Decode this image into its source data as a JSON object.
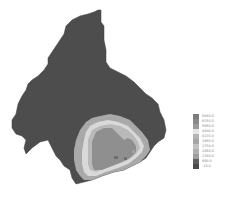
{
  "map": {
    "type": "raster-contour-map",
    "palette": {
      "outer_region": "#4d4d4d",
      "ring_outer": "#a9a9a9",
      "ring_bright": "#d9d9d9",
      "ring_mid": "#bdbdbd",
      "core": "#8f8f8f",
      "core_dark": "#6f6f6f"
    }
  },
  "legend": {
    "items": [
      {
        "label": "6840.0",
        "color": "#7c7c7c"
      },
      {
        "label": "6250.0",
        "color": "#8a8a8a"
      },
      {
        "label": "5660.0",
        "color": "#9a9a9a"
      },
      {
        "label": "4800.0",
        "color": "#e6e6e6"
      },
      {
        "label": "4130.0",
        "color": "#b5b5b5"
      },
      {
        "label": "3460.0",
        "color": "#a6a6a6"
      },
      {
        "label": "2750.0",
        "color": "#c2c2c2"
      },
      {
        "label": "2060.0",
        "color": "#b0b0b0"
      },
      {
        "label": "1380.0",
        "color": "#9e9e9e"
      },
      {
        "label": "690.0",
        "color": "#5e5e5e"
      },
      {
        "label": "-10.0",
        "color": "#4a4a4a"
      }
    ]
  }
}
